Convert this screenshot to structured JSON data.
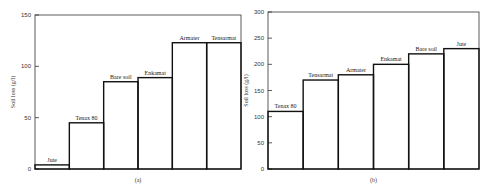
{
  "chart_data": [
    {
      "type": "bar",
      "panel": "(a)",
      "title": "",
      "xlabel": "(a)",
      "ylabel": "Soil loss (g/l)",
      "ylim": [
        0,
        150
      ],
      "yticks": [
        0,
        50,
        100,
        150
      ],
      "grid": false,
      "legend": "none",
      "categories": [
        "Jute",
        "Tenax 80",
        "Bare soil",
        "Enkamat",
        "Armater",
        "Tensarmat"
      ],
      "values": [
        4,
        45,
        85,
        89,
        123,
        123
      ]
    },
    {
      "type": "bar",
      "panel": "(b)",
      "title": "",
      "xlabel": "(b)",
      "ylabel": "Soil loss (g/l)",
      "ylim": [
        0,
        300
      ],
      "yticks": [
        0,
        50,
        100,
        150,
        200,
        250,
        300
      ],
      "grid": false,
      "legend": "none",
      "categories": [
        "Tenax 80",
        "Tensarmat",
        "Armater",
        "Enkamat",
        "Bare soil",
        "Jute"
      ],
      "values": [
        110,
        170,
        180,
        200,
        220,
        230
      ]
    }
  ],
  "layout": {
    "panels": [
      {
        "x0": 35,
        "x1": 241,
        "ytop": 15,
        "ybot": 169,
        "label_y": 182
      },
      {
        "x0": 268,
        "x1": 479,
        "ytop": 12,
        "ybot": 169,
        "label_y": 182
      }
    ],
    "colors": {
      "axis": "#333333",
      "bar": "#111111"
    }
  }
}
